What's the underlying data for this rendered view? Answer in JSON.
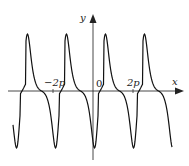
{
  "chart_data": {
    "type": "line",
    "title": "",
    "xlabel": "x",
    "ylabel": "y",
    "origin_label": "0",
    "tick_labels": [
      "-2p",
      "2p"
    ],
    "grid": false,
    "legend": null,
    "x_range_approx": [
      -3.5,
      3.5
    ],
    "series": [
      {
        "name": "f(x)",
        "peaks_x_px": [
          37,
          76,
          115,
          154
        ],
        "troughs_x_px": [
          50,
          89,
          128,
          167
        ],
        "plateaus_x_px": [
          22,
          61,
          100,
          139
        ]
      }
    ]
  },
  "labels": {
    "y_axis": "y",
    "x_axis": "x",
    "origin": "0",
    "tick_neg": "−2p",
    "tick_pos": "2p"
  }
}
